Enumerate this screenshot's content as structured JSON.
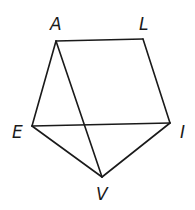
{
  "diagram": {
    "type": "geometry-figure",
    "vertices": [
      {
        "id": "A",
        "label": "A",
        "x": 56,
        "y": 41,
        "label_x": 50,
        "label_y": 30
      },
      {
        "id": "L",
        "label": "L",
        "x": 143,
        "y": 39,
        "label_x": 139,
        "label_y": 30
      },
      {
        "id": "E",
        "label": "E",
        "x": 32,
        "y": 126,
        "label_x": 12,
        "label_y": 138
      },
      {
        "id": "I",
        "label": "I",
        "x": 170,
        "y": 123,
        "label_x": 180,
        "label_y": 138
      },
      {
        "id": "V",
        "label": "V",
        "x": 102,
        "y": 177,
        "label_x": 96,
        "label_y": 200
      }
    ],
    "edges": [
      {
        "from": "A",
        "to": "L"
      },
      {
        "from": "L",
        "to": "I"
      },
      {
        "from": "A",
        "to": "E"
      },
      {
        "from": "E",
        "to": "I"
      },
      {
        "from": "A",
        "to": "V"
      },
      {
        "from": "E",
        "to": "V"
      },
      {
        "from": "I",
        "to": "V"
      }
    ],
    "stroke_color": "#1a1a1a",
    "background": "#ffffff"
  }
}
